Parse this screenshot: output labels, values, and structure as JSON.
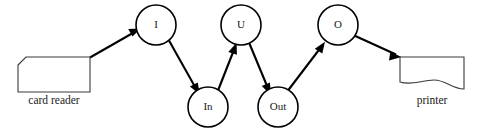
{
  "diagram": {
    "type": "flow-diagram",
    "width": 480,
    "height": 131,
    "background_color": "#ffffff",
    "stroke_color": "#000000",
    "device_stroke_color": "#3a3a3a",
    "nodes": [
      {
        "id": "I",
        "label": "I",
        "shape": "circle",
        "cx": 156,
        "cy": 25,
        "r": 20
      },
      {
        "id": "U",
        "label": "U",
        "shape": "circle",
        "cx": 241,
        "cy": 25,
        "r": 20
      },
      {
        "id": "O",
        "label": "O",
        "shape": "circle",
        "cx": 338,
        "cy": 25,
        "r": 20
      },
      {
        "id": "In",
        "label": "In",
        "shape": "circle",
        "cx": 208,
        "cy": 107,
        "r": 20
      },
      {
        "id": "Out",
        "label": "Out",
        "shape": "circle",
        "cx": 278,
        "cy": 107,
        "r": 20
      }
    ],
    "devices": [
      {
        "id": "card-reader",
        "label": "card reader",
        "shape": "punched-card",
        "x": 18,
        "y": 57,
        "width": 72,
        "height": 35,
        "label_x": 54,
        "label_y": 101
      },
      {
        "id": "printer",
        "label": "printer",
        "shape": "document",
        "x": 400,
        "y": 57,
        "width": 64,
        "height": 33,
        "label_x": 432,
        "label_y": 101
      }
    ],
    "edges": [
      {
        "id": "card-reader-to-I",
        "from": "card-reader",
        "to": "I",
        "direction": "up-right",
        "arrow": "end"
      },
      {
        "id": "I-to-In",
        "from": "I",
        "to": "In",
        "direction": "down-right",
        "arrow": "end"
      },
      {
        "id": "In-to-U",
        "from": "In",
        "to": "U",
        "direction": "up-right",
        "arrow": "end"
      },
      {
        "id": "U-to-Out",
        "from": "U",
        "to": "Out",
        "direction": "down-right",
        "arrow": "end"
      },
      {
        "id": "Out-to-O",
        "from": "Out",
        "to": "O",
        "direction": "up-right",
        "arrow": "end"
      },
      {
        "id": "O-to-printer",
        "from": "O",
        "to": "printer",
        "direction": "down-right",
        "arrow": "end"
      }
    ]
  }
}
